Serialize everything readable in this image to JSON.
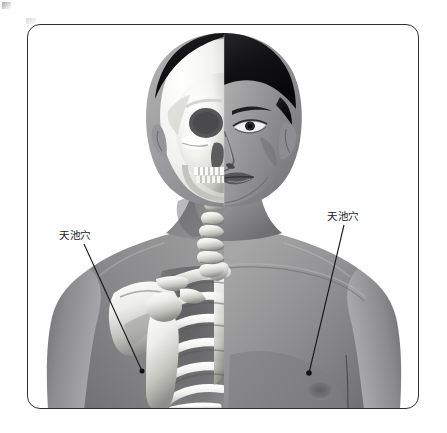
{
  "figure": {
    "kind": "anatomical-illustration",
    "frame": {
      "border_color": "#2e2e33",
      "background_color": "#ffffff",
      "corner_radius_px": 13
    },
    "palette": {
      "background": "#ffffff",
      "skin_mid": "#8f8f8f",
      "skin_light": "#bdbdbd",
      "skin_shadow": "#636366",
      "hair_dark": "#121214",
      "bone_light": "#f4f4f2",
      "bone_mid": "#c9c9c5",
      "bone_shadow": "#7a7a78",
      "line": "#1b1b1f",
      "marker_dot": "#111114"
    }
  },
  "annotations": [
    {
      "id": "acupoint-left",
      "label": "天池穴",
      "side": "skeleton-side",
      "description": "label with leader line ending at a dot over the rib cage (4th intercostal space)",
      "label_position": {
        "x": 59,
        "y": 230
      },
      "leader_line": {
        "x1": 83,
        "y1": 243,
        "x2": 141,
        "y2": 370
      },
      "marker_dot": {
        "x": 141,
        "y": 370
      }
    },
    {
      "id": "acupoint-right",
      "label": "天池穴",
      "side": "skin-side",
      "description": "label with leader line ending at a dot lateral to the nipple on the chest surface",
      "label_position": {
        "x": 327,
        "y": 211
      },
      "leader_line": {
        "x1": 343,
        "y1": 224,
        "x2": 308,
        "y2": 372
      },
      "marker_dot": {
        "x": 308,
        "y": 372
      }
    }
  ],
  "anatomy_regions": [
    {
      "name": "skull",
      "side": "left",
      "rendered_as": "bone"
    },
    {
      "name": "face",
      "side": "right",
      "rendered_as": "skin"
    },
    {
      "name": "teeth",
      "side": "left",
      "rendered_as": "bone"
    },
    {
      "name": "cervical-vertebrae",
      "side": "left",
      "rendered_as": "bone"
    },
    {
      "name": "clavicle",
      "side": "left",
      "rendered_as": "bone"
    },
    {
      "name": "scapula",
      "side": "left",
      "rendered_as": "bone"
    },
    {
      "name": "humerus",
      "side": "left",
      "rendered_as": "bone"
    },
    {
      "name": "rib-cage",
      "side": "left",
      "rendered_as": "bone"
    },
    {
      "name": "sternum",
      "side": "left",
      "rendered_as": "bone"
    },
    {
      "name": "pectoral-chest",
      "side": "right",
      "rendered_as": "skin"
    },
    {
      "name": "nipple",
      "side": "right",
      "rendered_as": "skin"
    },
    {
      "name": "shoulder-arm",
      "side": "both",
      "rendered_as": "skin"
    }
  ]
}
